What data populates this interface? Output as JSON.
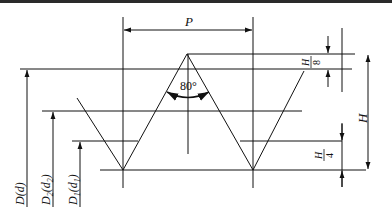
{
  "diagram": {
    "colors": {
      "line": "#111111",
      "background": "#ffffff",
      "top_border": "#2a2a2a"
    },
    "labels": {
      "pitch": "P",
      "angle": "80°",
      "height": "H",
      "h8_num": "H",
      "h8_den": "8",
      "h4_num": "H",
      "h4_den": "4",
      "major_diameter": "D(d)",
      "pitch_diameter": "D2(d2)",
      "minor_diameter": "D1(d1)",
      "major_main": "D",
      "major_sub": "d",
      "pitch_main": "D",
      "pitch_idx": "2",
      "pitch_sub": "d",
      "pitch_sub_idx": "2",
      "minor_main": "D",
      "minor_idx": "1",
      "minor_sub": "d",
      "minor_sub_idx": "1"
    }
  }
}
